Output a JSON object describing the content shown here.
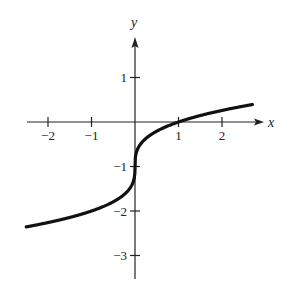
{
  "chart_data": {
    "type": "line",
    "title": "",
    "xlabel": "x",
    "ylabel": "y",
    "function": "y = cbrt(x) - 1",
    "xlim": [
      -2.5,
      2.9
    ],
    "ylim": [
      -3.5,
      2.0
    ],
    "grid": false,
    "x_ticks": [
      -2,
      -1,
      1,
      2
    ],
    "x_tick_labels": [
      "−2",
      "−1",
      "1",
      "2"
    ],
    "y_ticks": [
      1,
      -1,
      -2,
      -3
    ],
    "y_tick_labels": [
      "1",
      "−1",
      "−2",
      "−3"
    ],
    "series": [
      {
        "name": "curve",
        "x": [
          -2.5,
          -2.0,
          -1.5,
          -1.0,
          -0.5,
          -0.1,
          0,
          0.1,
          0.5,
          1.0,
          1.5,
          2.0,
          2.7
        ],
        "y": [
          -2.36,
          -2.26,
          -2.14,
          -2.0,
          -1.79,
          -1.46,
          -1.0,
          -0.54,
          -0.21,
          0.0,
          0.14,
          0.26,
          0.39
        ]
      }
    ],
    "color": "#111111"
  }
}
